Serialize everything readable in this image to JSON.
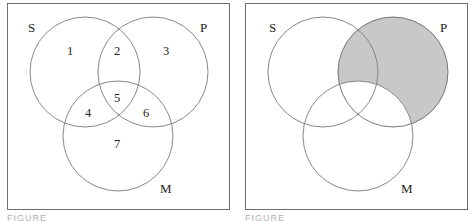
{
  "figures": [
    {
      "caption": "FIGURE 10",
      "circle_labels": {
        "s": "S",
        "p": "P",
        "m": "M"
      },
      "regions": [
        "1",
        "2",
        "3",
        "4",
        "5",
        "6",
        "7"
      ]
    },
    {
      "caption": "FIGURE 11",
      "circle_labels": {
        "s": "S",
        "p": "P",
        "m": "M"
      },
      "shaded_region": "P outside M",
      "shade_color": "#c8c8c8"
    }
  ],
  "colors": {
    "line": "#7a7a7a",
    "frame": "#6e6e6e",
    "shade": "#c8c8c8",
    "caption": "#b0b0b0"
  }
}
